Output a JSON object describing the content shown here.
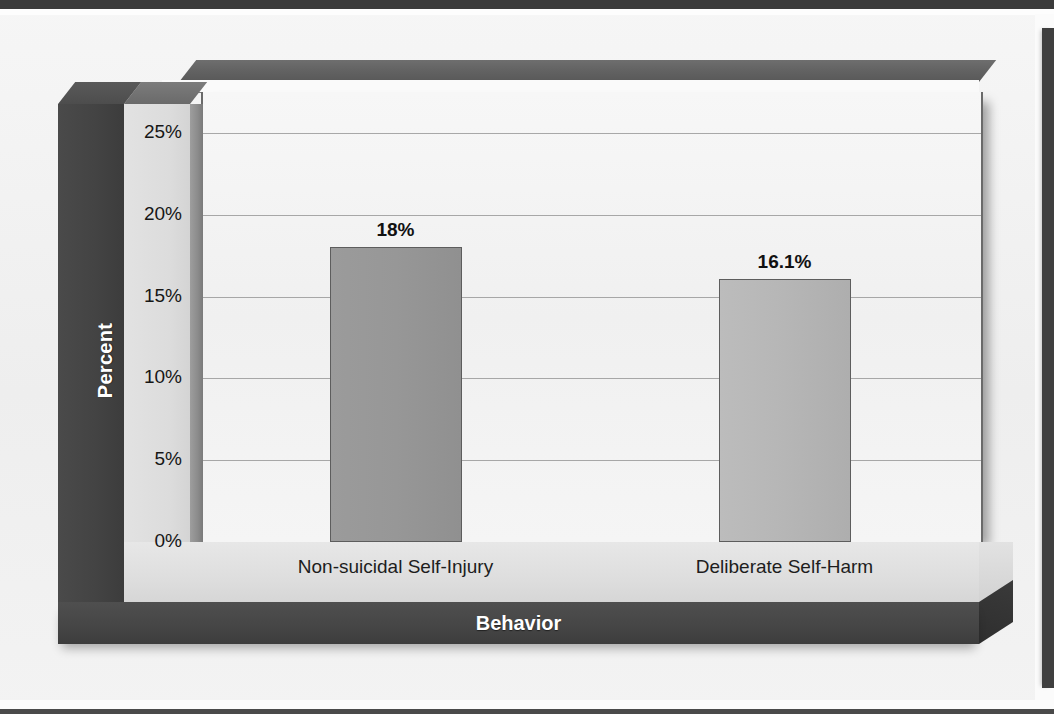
{
  "chart_data": {
    "type": "bar",
    "title": "",
    "subtitle": "",
    "xlabel": "Behavior",
    "ylabel": "Percent",
    "categories": [
      "Non-suicidal Self-Injury",
      "Deliberate Self-Harm"
    ],
    "values": [
      18,
      16.1
    ],
    "data_labels": [
      "18%",
      "16.1%"
    ],
    "ylim": [
      0,
      27.5
    ],
    "yticks": [
      0,
      5,
      10,
      15,
      20,
      25
    ],
    "ytick_labels": [
      "0%",
      "5%",
      "10%",
      "15%",
      "20%",
      "25%"
    ],
    "grid": true,
    "legend": false,
    "legend_position": "none",
    "style": "3d-bar",
    "series": [
      {
        "name": "Percent",
        "values": [
          18,
          16.1
        ]
      }
    ],
    "bar_colors": [
      "#979797",
      "#b6b6b6"
    ]
  },
  "axes": {
    "y": {
      "label": "Percent",
      "ticks": [
        {
          "label": "25%",
          "value": 25
        },
        {
          "label": "20%",
          "value": 20
        },
        {
          "label": "15%",
          "value": 15
        },
        {
          "label": "10%",
          "value": 10
        },
        {
          "label": "5%",
          "value": 5
        },
        {
          "label": "0%",
          "value": 0
        }
      ]
    },
    "x": {
      "label": "Behavior",
      "ticks": [
        {
          "label": "Non-suicidal Self-Injury"
        },
        {
          "label": "Deliberate Self-Harm"
        }
      ]
    }
  },
  "colors": {
    "page_background": "#f1f1f1",
    "plot_background": "#f3f3f3",
    "axis_block": "#dcdcdc",
    "spine_dark": "#434343",
    "base_dark": "#464646",
    "gridline": "#8e8e8e",
    "bar_one": "#979797",
    "bar_two": "#b6b6b6",
    "label_text": "#111111",
    "inverse_text": "#ffffff"
  }
}
